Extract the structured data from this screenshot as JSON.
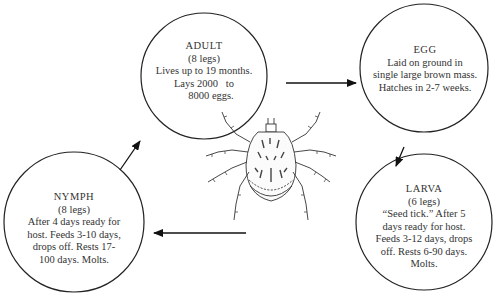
{
  "diagram": {
    "type": "life-cycle",
    "subject": "tick",
    "stages": [
      {
        "id": "adult",
        "title": "ADULT",
        "lines": [
          "(8 legs)",
          "Lives up to 19 months.",
          "Lays 2000   to",
          "8000 eggs."
        ]
      },
      {
        "id": "egg",
        "title": "EGG",
        "lines": [
          "Laid on ground in",
          "single large brown mass.",
          "Hatches in 2-7 weeks."
        ]
      },
      {
        "id": "larva",
        "title": "LARVA",
        "lines": [
          "(6 legs)",
          "“Seed tick.” After 5",
          "days ready for host.",
          "Feeds 3-12 days, drops",
          "off. Rests 6-90 days.",
          "Molts."
        ]
      },
      {
        "id": "nymph",
        "title": "NYMPH",
        "lines": [
          "(8 legs)",
          "After 4 days ready for",
          "host. Feeds 3-10 days,",
          "drops off. Rests 17-",
          "100 days. Molts."
        ]
      }
    ],
    "arrows": [
      {
        "from": "adult",
        "to": "egg"
      },
      {
        "from": "egg",
        "to": "larva"
      },
      {
        "from": "larva",
        "to": "nymph"
      },
      {
        "from": "nymph",
        "to": "adult"
      }
    ],
    "center_illustration": "tick-icon"
  }
}
